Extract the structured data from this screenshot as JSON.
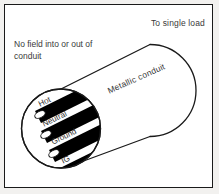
{
  "figure": {
    "frame": {
      "border_color": "#1a1a1a",
      "background_color": "#ffffff",
      "page_background": "#f2f1ef"
    },
    "annotations": {
      "to_single_load": "To single load",
      "no_field": "No field into or out of conduit",
      "metallic_conduit": "Metallic conduit"
    },
    "conduit": {
      "name": "metallic-conduit",
      "shape": "cylinder",
      "outline_color": "#1a1a1a",
      "fill_color": "#ffffff"
    },
    "cross_section": {
      "name": "conduit-cross-section",
      "shape": "circle",
      "outline_color": "#1a1a1a"
    },
    "conductors": [
      {
        "id": "hot",
        "label": "Hot",
        "color": "#000000"
      },
      {
        "id": "neutral",
        "label": "Neutral",
        "color": "#000000"
      },
      {
        "id": "ground",
        "label": "Ground",
        "color": "#000000"
      },
      {
        "id": "ig",
        "label": "IG",
        "color": "#000000"
      }
    ]
  }
}
